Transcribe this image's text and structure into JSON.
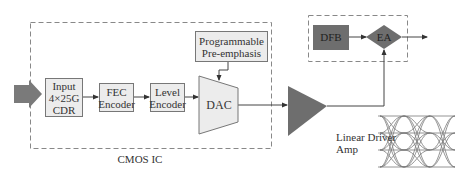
{
  "diagram": {
    "cmos_region": {
      "label": "CMOS IC"
    },
    "input_block": {
      "line1": "Input",
      "line2": "4×25G",
      "line3": "CDR"
    },
    "fec_block": {
      "line1": "FEC",
      "line2": "Encoder"
    },
    "level_block": {
      "line1": "Level",
      "line2": "Encoder"
    },
    "dac_block": {
      "label": "DAC"
    },
    "preemphasis_block": {
      "line1": "Programmable",
      "line2": "Pre-emphasis"
    },
    "driver": {
      "line1": "Linear Driver",
      "line2": "Amp"
    },
    "optical": {
      "dfb_label": "DFB",
      "ea_label": "EA"
    },
    "colors": {
      "block_fill": "#ececec",
      "block_border": "#777777",
      "dark_fill": "#6e6e6e",
      "arrow_fill": "#7a7a7a",
      "line": "#444444",
      "dashed": "#888888"
    }
  }
}
